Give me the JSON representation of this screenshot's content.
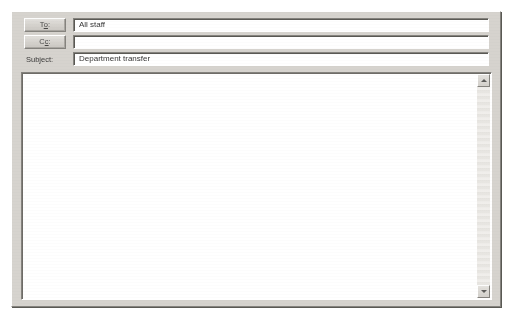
{
  "window": {
    "title": "Compose Message",
    "style": "classic-windows-dialog",
    "colors": {
      "face": "#d6d3ce",
      "highlight": "#ffffff",
      "shadow": "#85837e",
      "dark_shadow": "#5a5954",
      "field_background": "#ffffff",
      "text": "#1e1e1e",
      "page_background": "#ffffff"
    }
  },
  "header": {
    "rows": [
      {
        "key": "to",
        "control": "button",
        "label_prefix": "T",
        "label_accel": "o",
        "label_suffix": ":",
        "label_full": "To:",
        "value": "All staff",
        "placeholder": ""
      },
      {
        "key": "cc",
        "control": "button",
        "label_prefix": "C",
        "label_accel": "c",
        "label_suffix": ":",
        "label_full": "Cc:",
        "value": "",
        "placeholder": ""
      },
      {
        "key": "subject",
        "control": "label",
        "label_prefix": "",
        "label_accel": "S",
        "label_suffix": "ubject:",
        "label_full": "Subject:",
        "value": "Department transfer",
        "placeholder": ""
      }
    ]
  },
  "body": {
    "value": "",
    "placeholder": "",
    "scrollbar": {
      "orientation": "vertical",
      "up_arrow_icon": "arrow-up-icon",
      "down_arrow_icon": "arrow-down-icon",
      "thumb_visible": false,
      "scroll_position_percent": 0
    }
  }
}
